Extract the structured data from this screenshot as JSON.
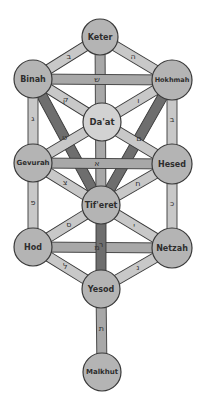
{
  "diagram": {
    "colors": {
      "background": "#ffffff",
      "node_fill": "#b4b4b4",
      "node_fill_daat": "#d2d2d2",
      "node_stroke": "#3a3a3a",
      "path_light": "#c8c8c8",
      "path_mid": "#a8a8a8",
      "path_dark": "#6e6e6e",
      "path_stroke": "#3a3a3a",
      "label_color": "#2e2e2e"
    },
    "nodes": [
      {
        "id": "keter",
        "label": "Keter",
        "x": 100,
        "y": 37,
        "r": 18,
        "font_size": 8
      },
      {
        "id": "binah",
        "label": "Binah",
        "x": 33,
        "y": 79,
        "r": 19,
        "font_size": 8
      },
      {
        "id": "hokhmah",
        "label": "Hokhmah",
        "x": 172,
        "y": 80,
        "r": 20,
        "font_size": 6.5
      },
      {
        "id": "daat",
        "label": "Da'at",
        "x": 102,
        "y": 122,
        "r": 19,
        "font_size": 8.5
      },
      {
        "id": "gevurah",
        "label": "Gevurah",
        "x": 33,
        "y": 163,
        "r": 19,
        "font_size": 7
      },
      {
        "id": "hesed",
        "label": "Hesed",
        "x": 172,
        "y": 164,
        "r": 20,
        "font_size": 8
      },
      {
        "id": "tiferet",
        "label": "Tif'eret",
        "x": 101,
        "y": 205,
        "r": 19,
        "font_size": 8
      },
      {
        "id": "hod",
        "label": "Hod",
        "x": 33,
        "y": 247,
        "r": 19,
        "font_size": 8
      },
      {
        "id": "netzah",
        "label": "Netzah",
        "x": 172,
        "y": 248,
        "r": 20,
        "font_size": 8
      },
      {
        "id": "yesod",
        "label": "Yesod",
        "x": 101,
        "y": 289,
        "r": 19,
        "font_size": 8
      },
      {
        "id": "malkhut",
        "label": "Malkhut",
        "x": 102,
        "y": 372,
        "r": 19,
        "font_size": 7
      }
    ],
    "paths": [
      {
        "from": "binah",
        "to": "tiferet",
        "letter": "ט",
        "shade": "dark"
      },
      {
        "from": "hokhmah",
        "to": "tiferet",
        "letter": "ם",
        "shade": "dark"
      },
      {
        "from": "keter",
        "to": "tiferet",
        "letter": "ג",
        "shade": "mid"
      },
      {
        "from": "keter",
        "to": "binah",
        "letter": "ב",
        "shade": "light"
      },
      {
        "from": "keter",
        "to": "hokhmah",
        "letter": "ה",
        "shade": "light"
      },
      {
        "from": "binah",
        "to": "hokhmah",
        "letter": "ש",
        "shade": "mid"
      },
      {
        "from": "binah",
        "to": "daat",
        "letter": "ק",
        "shade": "light"
      },
      {
        "from": "hokhmah",
        "to": "daat",
        "letter": "ו",
        "shade": "light"
      },
      {
        "from": "binah",
        "to": "gevurah",
        "letter": "ג",
        "shade": "light"
      },
      {
        "from": "hokhmah",
        "to": "hesed",
        "letter": "ב",
        "shade": "light"
      },
      {
        "from": "daat",
        "to": "gevurah",
        "letter": "",
        "shade": "light"
      },
      {
        "from": "daat",
        "to": "hesed",
        "letter": "",
        "shade": "light"
      },
      {
        "from": "gevurah",
        "to": "hesed",
        "letter": "א",
        "shade": "mid"
      },
      {
        "from": "gevurah",
        "to": "tiferet",
        "letter": "צ",
        "shade": "light"
      },
      {
        "from": "hesed",
        "to": "tiferet",
        "letter": "ח",
        "shade": "light"
      },
      {
        "from": "gevurah",
        "to": "hod",
        "letter": "פ",
        "shade": "light"
      },
      {
        "from": "hesed",
        "to": "netzah",
        "letter": "כ",
        "shade": "light"
      },
      {
        "from": "tiferet",
        "to": "hod",
        "letter": "ס",
        "shade": "light"
      },
      {
        "from": "tiferet",
        "to": "netzah",
        "letter": "י",
        "shade": "light"
      },
      {
        "from": "hod",
        "to": "netzah",
        "letter": "מ",
        "shade": "mid"
      },
      {
        "from": "tiferet",
        "to": "yesod",
        "letter": "ר",
        "shade": "dark"
      },
      {
        "from": "hod",
        "to": "yesod",
        "letter": "ל",
        "shade": "light"
      },
      {
        "from": "netzah",
        "to": "yesod",
        "letter": "נ",
        "shade": "light"
      },
      {
        "from": "yesod",
        "to": "malkhut",
        "letter": "ת",
        "shade": "mid"
      }
    ],
    "path_width": 10
  }
}
